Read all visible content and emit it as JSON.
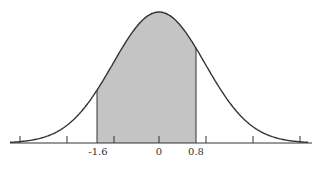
{
  "chart_data": {
    "type": "area",
    "title": "",
    "xlabel": "",
    "ylabel": "",
    "distribution": {
      "mean": 0,
      "sd": 1
    },
    "shaded_region": {
      "from": -1.6,
      "to": 0.8
    },
    "tick_labels": [
      "-1.6",
      "0",
      "0.8"
    ],
    "tick_marks_count": 7,
    "grid": false,
    "colors": {
      "curve": "#333333",
      "fill": "#c4c4c4",
      "axis": "#333333"
    }
  },
  "labels": {
    "left": "-1.6",
    "center": "0",
    "right": "0.8"
  }
}
